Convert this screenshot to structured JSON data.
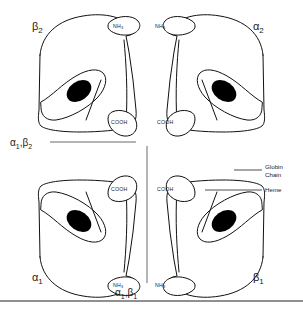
{
  "figure": {
    "type": "diagram",
    "background_color": "#ffffff",
    "line_color": "#111111",
    "heme_color": "#000000"
  },
  "subunits": [
    {
      "id": "beta2",
      "label_greek": "β",
      "label_sub": "2",
      "quadrant": "top-left",
      "n_terminus": "NH",
      "n_terminus_sub": "3",
      "c_terminus": "COOH"
    },
    {
      "id": "alpha2",
      "label_greek": "α",
      "label_sub": "2",
      "quadrant": "top-right",
      "n_terminus": "NH",
      "n_terminus_sub": "3",
      "c_terminus": "COOH"
    },
    {
      "id": "alpha1",
      "label_greek": "α",
      "label_sub": "1",
      "quadrant": "bottom-left",
      "n_terminus": "NH",
      "n_terminus_sub": "3",
      "c_terminus": "COOH"
    },
    {
      "id": "beta1",
      "label_greek": "β",
      "label_sub": "1",
      "quadrant": "bottom-right",
      "n_terminus": "NH",
      "n_terminus_sub": "3",
      "c_terminus": "COOH"
    }
  ],
  "interfaces": [
    {
      "id": "a1b2",
      "greek_first": "α",
      "sub_first": "1",
      "separator": ",",
      "greek_second": "β",
      "sub_second": "2",
      "position": "left-middle"
    },
    {
      "id": "a1b1",
      "greek_first": "α",
      "sub_first": "1",
      "separator": ",",
      "greek_second": "β",
      "sub_second": "1",
      "position": "bottom-center"
    }
  ],
  "legend": {
    "globin_line1": "Globin",
    "globin_line2": "Chain",
    "heme": "Heme"
  }
}
